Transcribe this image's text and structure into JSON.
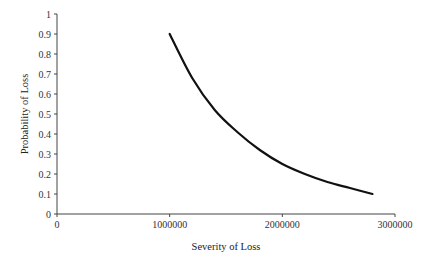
{
  "chart_data": {
    "type": "line",
    "title": "",
    "xlabel": "Severity of Loss",
    "ylabel": "Probability of Loss",
    "xlim": [
      0,
      3000000
    ],
    "ylim": [
      0,
      1
    ],
    "x_ticks": [
      0,
      1000000,
      2000000,
      3000000
    ],
    "x_tick_labels": [
      "0",
      "1000000",
      "2000000",
      "3000000"
    ],
    "y_ticks": [
      0,
      0.1,
      0.2,
      0.3,
      0.4,
      0.5,
      0.6,
      0.7,
      0.8,
      0.9,
      1
    ],
    "y_tick_labels": [
      "0",
      "0.1",
      "0.2",
      "0.3",
      "0.4",
      "0.5",
      "0.6",
      "0.7",
      "0.8",
      "0.9",
      "1"
    ],
    "grid": false,
    "legend": null,
    "series": [
      {
        "name": "Probability vs Severity",
        "color": "#111111",
        "x": [
          1000000,
          1200000,
          1400000,
          1600000,
          1800000,
          2000000,
          2200000,
          2400000,
          2600000,
          2800000
        ],
        "y": [
          0.9,
          0.68,
          0.52,
          0.41,
          0.32,
          0.25,
          0.2,
          0.16,
          0.13,
          0.1
        ]
      }
    ]
  }
}
